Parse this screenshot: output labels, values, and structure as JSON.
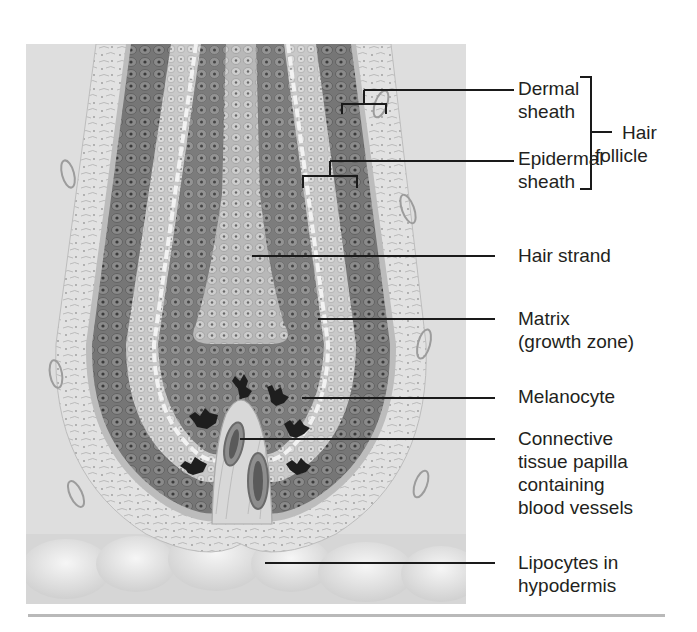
{
  "figure": {
    "labels": [
      {
        "id": "dermal-sheath",
        "lines": [
          "Dermal",
          "sheath"
        ]
      },
      {
        "id": "epidermal-sheath",
        "lines": [
          "Epidermal",
          "sheath"
        ]
      },
      {
        "id": "hair-follicle",
        "lines": [
          "Hair",
          "follicle"
        ]
      },
      {
        "id": "hair-strand",
        "lines": [
          "Hair strand"
        ]
      },
      {
        "id": "matrix",
        "lines": [
          "Matrix",
          "(growth zone)"
        ]
      },
      {
        "id": "melanocyte",
        "lines": [
          "Melanocyte"
        ]
      },
      {
        "id": "papilla",
        "lines": [
          "Connective",
          "tissue papilla",
          "containing",
          "blood vessels"
        ]
      },
      {
        "id": "lipocytes",
        "lines": [
          "Lipocytes in",
          "hypodermis"
        ]
      }
    ]
  },
  "colors": {
    "background": "#ffffff",
    "illustration_bg": "#dcdcdc",
    "dark_cells": "#6e6e6e",
    "light_cells": "#c4c4c4",
    "melanocyte": "#1e1e1e",
    "leader_lines": "#1a1a1a",
    "text": "#231f20",
    "rule": "#b9b9b9"
  }
}
